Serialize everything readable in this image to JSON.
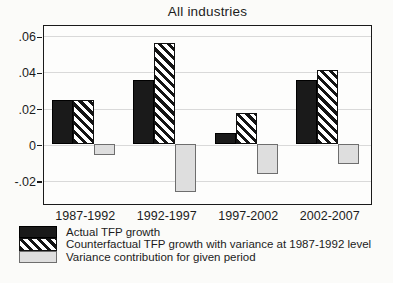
{
  "title": "All industries",
  "chart_data": {
    "type": "bar",
    "title": "All industries",
    "categories": [
      "1987-1992",
      "1992-1997",
      "1997-2002",
      "2002-2007"
    ],
    "series": [
      {
        "key": "actual-tfp-growth",
        "name": "Actual TFP growth",
        "style": "solid-black",
        "values": [
          0.024,
          0.035,
          0.006,
          0.035
        ]
      },
      {
        "key": "counterfactual-tfp-growth",
        "name": "Counterfactual TFP growth with variance at 1987-1992 level",
        "style": "diagonal-hatch",
        "values": [
          0.024,
          0.056,
          0.017,
          0.041
        ]
      },
      {
        "key": "variance-contribution",
        "name": "Variance contribution for given period",
        "style": "light-gray",
        "values": [
          -0.006,
          -0.027,
          -0.017,
          -0.011
        ]
      }
    ],
    "ylim": [
      -0.032,
      0.066
    ],
    "yticks": {
      "labels": [
        ".06",
        ".04",
        ".02",
        "0",
        "-.02"
      ],
      "values": [
        0.06,
        0.04,
        0.02,
        0,
        -0.02
      ]
    },
    "xlabel": "",
    "ylabel": "",
    "grid": "horizontal",
    "legend_position": "bottom-left"
  },
  "colors": {
    "bar_solid": "#1a1a1a",
    "bar_hatch_stripe": "#141414",
    "bar_gray_fill": "#dedede",
    "bar_gray_border": "#6e6e6e",
    "gridline": "#d9d9d9",
    "plot_border": "#1a1a1a",
    "background": "#fbfbf9",
    "text": "#1c1c1c"
  }
}
